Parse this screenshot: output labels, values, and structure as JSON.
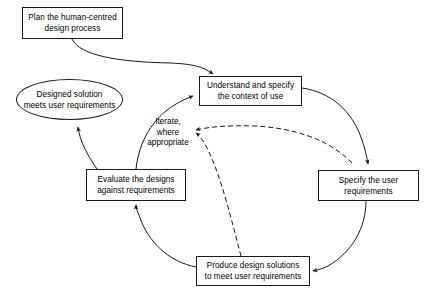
{
  "diagram": {
    "title": "Human-centred design process",
    "type": "flowchart",
    "colors": {
      "stroke": "#1a1a1a",
      "text": "#000000",
      "background": "#ffffff"
    },
    "nodes": [
      {
        "id": "plan",
        "shape": "rectangle",
        "label": "Plan the human-centred\ndesign process"
      },
      {
        "id": "outcome",
        "shape": "ellipse",
        "label": "Designed solution\nmeets user requirements"
      },
      {
        "id": "understand",
        "shape": "rectangle",
        "label": "Understand and specify\nthe context of use"
      },
      {
        "id": "specify",
        "shape": "rectangle",
        "label": "Specify the user\nrequirements"
      },
      {
        "id": "evaluate",
        "shape": "rectangle",
        "label": "Evaluate the designs\nagainst requirements"
      },
      {
        "id": "produce",
        "shape": "rectangle",
        "label": "Produce design solutions\nto meet user requirements"
      }
    ],
    "annotations": [
      {
        "id": "iterate",
        "label": "Iterate,\nwhere\nappropriate"
      }
    ],
    "edges": [
      {
        "id": "plan-to-understand",
        "from": "plan",
        "to": "understand",
        "style": "solid",
        "arrow": true
      },
      {
        "id": "understand-to-specify",
        "from": "understand",
        "to": "specify",
        "style": "solid",
        "arrow": true
      },
      {
        "id": "specify-to-produce",
        "from": "specify",
        "to": "produce",
        "style": "solid",
        "arrow": true
      },
      {
        "id": "produce-to-evaluate",
        "from": "produce",
        "to": "evaluate",
        "style": "solid",
        "arrow": true
      },
      {
        "id": "evaluate-to-understand",
        "from": "evaluate",
        "to": "understand",
        "style": "solid",
        "arrow": true
      },
      {
        "id": "evaluate-to-outcome",
        "from": "evaluate",
        "to": "outcome",
        "style": "solid",
        "arrow": true
      },
      {
        "id": "specify-iterate-back",
        "from": "specify",
        "to": "iterate",
        "style": "dashed",
        "arrow": true
      },
      {
        "id": "produce-iterate-back",
        "from": "produce",
        "to": "iterate",
        "style": "dashed",
        "arrow": true
      }
    ]
  }
}
